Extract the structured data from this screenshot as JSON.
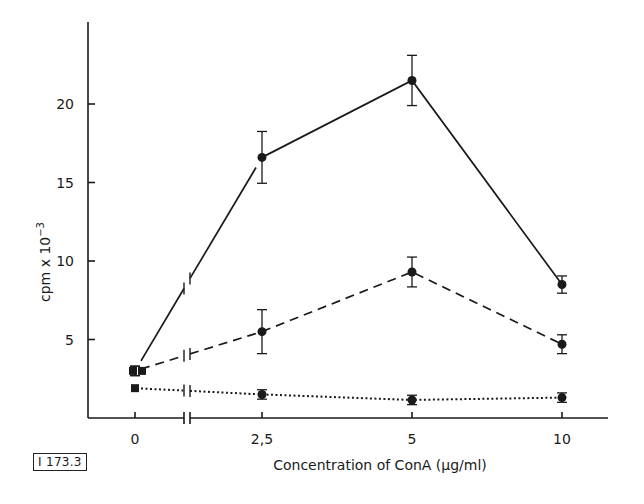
{
  "figure_id": "I 173.3",
  "chart_data": {
    "type": "line",
    "title": "",
    "xlabel": "Concentration of ConA (µg/ml)",
    "ylabel": "cpm x 10^-3",
    "ylabel_display": "cpm x 10",
    "ylabel_exponent": "−3",
    "x": [
      0,
      2.5,
      5,
      10
    ],
    "x_tick_labels": [
      "0",
      "2,5",
      "5",
      "10"
    ],
    "y_ticks": [
      5,
      10,
      15,
      20
    ],
    "y_tick_labels": [
      "5",
      "10",
      "15",
      "20"
    ],
    "ylim": [
      0,
      25
    ],
    "grid": false,
    "legend": "none",
    "x_axis_break_between": [
      0,
      2.5
    ],
    "series": [
      {
        "name": "solid",
        "line_style": "solid",
        "values": [
          3.0,
          16.6,
          21.5,
          8.5
        ],
        "error": [
          0.3,
          1.65,
          1.6,
          0.55
        ]
      },
      {
        "name": "dashed",
        "line_style": "dashed",
        "values": [
          3.0,
          5.5,
          9.3,
          4.7
        ],
        "error": [
          0.3,
          1.4,
          0.95,
          0.6
        ]
      },
      {
        "name": "dotted",
        "line_style": "dotted",
        "values": [
          1.9,
          1.5,
          1.15,
          1.3
        ],
        "error": [
          0.25,
          0.3,
          0.3,
          0.3
        ]
      }
    ]
  }
}
